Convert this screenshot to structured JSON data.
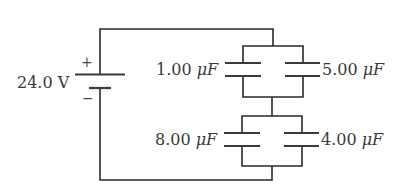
{
  "diagram": {
    "type": "circuit",
    "battery": {
      "label": "24.0 V",
      "positive_sign": "+",
      "negative_sign": "−"
    },
    "capacitors": [
      {
        "id": "C1",
        "value": "1.00",
        "unit": "μF",
        "group": "top",
        "side": "left"
      },
      {
        "id": "C2",
        "value": "5.00",
        "unit": "μF",
        "group": "top",
        "side": "right"
      },
      {
        "id": "C3",
        "value": "8.00",
        "unit": "μF",
        "group": "bottom",
        "side": "left"
      },
      {
        "id": "C4",
        "value": "4.00",
        "unit": "μF",
        "group": "bottom",
        "side": "right"
      }
    ],
    "topology": "Battery in series with two parallel capacitor pairs: (1.00 μF ∥ 5.00 μF) in series with (8.00 μF ∥ 4.00 μF)",
    "colors": {
      "line": "#2a2a2a",
      "text": "#3a3a3a",
      "background": "#ffffff"
    }
  }
}
